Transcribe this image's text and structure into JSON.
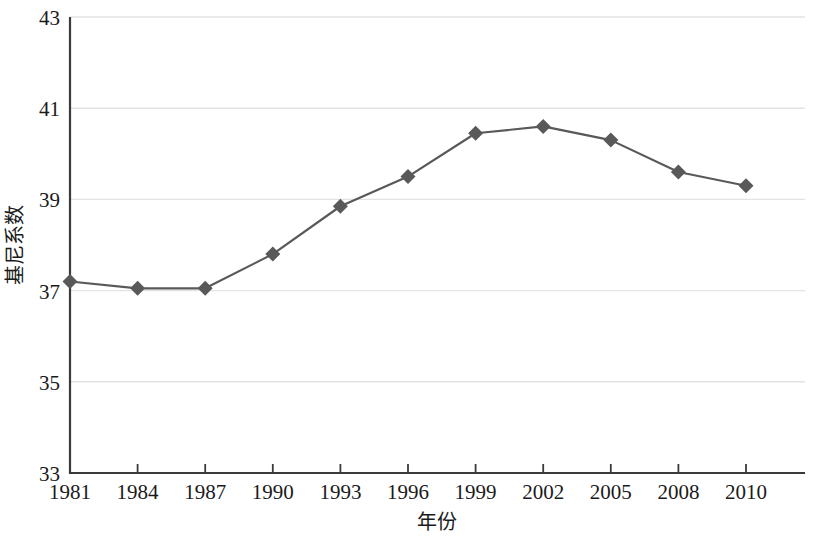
{
  "chart_data": {
    "type": "line",
    "title": "",
    "xlabel": "年份",
    "ylabel": "基尼系数",
    "categories": [
      "1981",
      "1984",
      "1987",
      "1990",
      "1993",
      "1996",
      "1999",
      "2002",
      "2005",
      "2008",
      "2010"
    ],
    "series": [
      {
        "name": "基尼系数",
        "values": [
          37.2,
          37.05,
          37.05,
          37.8,
          38.85,
          39.5,
          40.45,
          40.6,
          40.3,
          39.6,
          39.3
        ]
      }
    ],
    "ylim": [
      33,
      43
    ],
    "yticks": [
      "33",
      "35",
      "37",
      "39",
      "41",
      "43"
    ],
    "ytick_values": [
      33,
      35,
      37,
      39,
      41,
      43
    ],
    "xlim": [
      "1981",
      "2010"
    ],
    "grid": "horizontal",
    "legend": "none",
    "colors": {
      "line": "#595959",
      "marker": "#595959",
      "gridline": "#e3e3e3",
      "axis": "#3a3a3a",
      "background": "#ffffff",
      "text": "#1a1a1a"
    }
  }
}
